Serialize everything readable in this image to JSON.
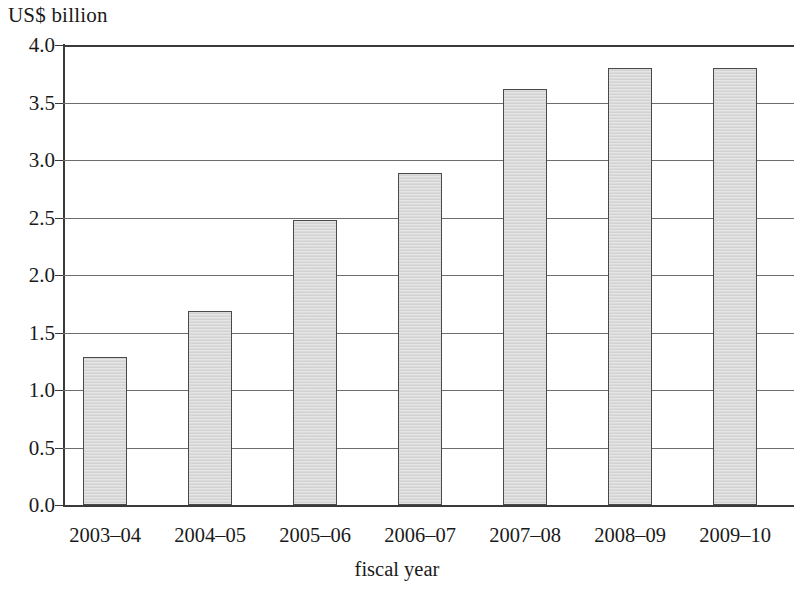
{
  "chart_data": {
    "type": "bar",
    "title": "",
    "subtitle": "",
    "ylabel": "US$ billion",
    "xlabel": "fiscal year",
    "categories": [
      "2003–04",
      "2004–05",
      "2005–06",
      "2006–07",
      "2007–08",
      "2008–09",
      "2009–10"
    ],
    "values": [
      1.29,
      1.69,
      2.48,
      2.89,
      3.62,
      3.8,
      3.8
    ],
    "ylim": [
      0.0,
      4.0
    ],
    "ytick_labels": [
      "4.0",
      "3.5",
      "3.0",
      "2.5",
      "2.0",
      "1.5",
      "1.0",
      "0.5",
      "0.0"
    ],
    "ytick_values": [
      4.0,
      3.5,
      3.0,
      2.5,
      2.0,
      1.5,
      1.0,
      0.5,
      0.0
    ],
    "grid": true,
    "legend": "none",
    "bar_fill_color": "#d9d9d9",
    "bar_border_color": "#4a4a4a",
    "axis_color": "#3a3a3a",
    "gridline_color": "#6d6d6d",
    "background_color": "#ffffff"
  }
}
